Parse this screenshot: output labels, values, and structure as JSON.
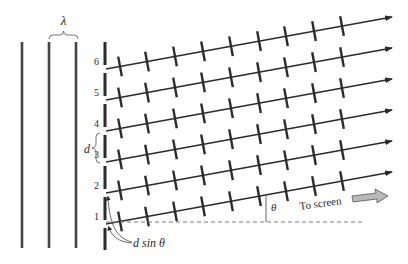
{
  "diagram": {
    "wavelength_label": "λ",
    "spacing_label": "d",
    "path_difference_label": "d sin θ",
    "angle_label": "θ",
    "direction_label": "To screen",
    "slit_labels": [
      "1",
      "2",
      "3",
      "4",
      "5",
      "6"
    ],
    "colors": {
      "line": "#2b2b2b",
      "dashed": "#7a7a7a",
      "arrow_fill": "#b8b8b8"
    }
  }
}
